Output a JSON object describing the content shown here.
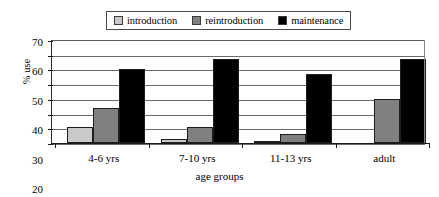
{
  "chart_data": {
    "type": "bar",
    "title": "",
    "subtitle": "",
    "xlabel": "age groups",
    "ylabel": "% use",
    "categories": [
      "4-6 yrs",
      "7-10 yrs",
      "11-13 yrs",
      "adult"
    ],
    "series": [
      {
        "name": "introduction",
        "color": "#c9c9c9",
        "values": [
          11,
          2.5,
          1.5,
          0
        ]
      },
      {
        "name": "reintroduction",
        "color": "#808080",
        "values": [
          24,
          11,
          6,
          30
        ]
      },
      {
        "name": "maintenance",
        "color": "#000000",
        "values": [
          50,
          57,
          47,
          57
        ]
      }
    ],
    "ylim": [
      0,
      70
    ],
    "ytick_step": 10,
    "yticks": [
      70,
      60,
      50,
      40,
      30,
      20,
      10,
      0
    ],
    "grid": true,
    "legend_position": "top-center"
  },
  "legend": {
    "entries": [
      {
        "label": "introduction"
      },
      {
        "label": "reintroduction"
      },
      {
        "label": "maintenance"
      }
    ]
  },
  "axes": {
    "y_title": "% use",
    "x_title": "age groups"
  }
}
